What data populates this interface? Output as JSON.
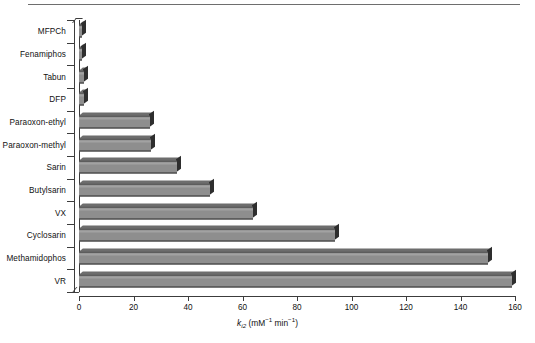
{
  "chart_data": {
    "type": "bar",
    "orientation": "horizontal",
    "title": "",
    "xlabel": "ki2 (mM-1 min-1)",
    "xlabel_parts": {
      "symbol": "k",
      "subscript": "i2",
      "units": "(mM",
      "unit_exp1": "−1",
      "unit_mid": " min",
      "unit_exp2": "−1",
      "unit_close": ")"
    },
    "ylabel": "",
    "categories": [
      "MFPCh",
      "Fenamiphos",
      "Tabun",
      "DFP",
      "Paraoxon-ethyl",
      "Paraoxon-methyl",
      "Sarin",
      "Butylsarin",
      "VX",
      "Cyclosarin",
      "Methamidophos",
      "VR"
    ],
    "values": [
      1,
      1.2,
      1.8,
      2,
      26,
      26.5,
      36,
      48,
      64,
      94,
      150,
      159
    ],
    "xlim": [
      0,
      160
    ],
    "xticks": [
      0,
      20,
      40,
      60,
      80,
      100,
      120,
      140,
      160
    ],
    "xtick_labels": [
      "0",
      "20",
      "40",
      "60",
      "80",
      "100",
      "120",
      "140",
      "160"
    ],
    "grid": false,
    "legend": null,
    "style": "3d-horizontal-bars",
    "colors": {
      "bar_face": "#8e8e8e",
      "bar_highlight": "#a2a2a2",
      "bar_side": "#2e2e2e",
      "bar_top": "#6d6d6d",
      "axis": "#3c3c3c",
      "text": "#111111",
      "background": "#ffffff",
      "top_rule": "#6e6e6e"
    }
  }
}
